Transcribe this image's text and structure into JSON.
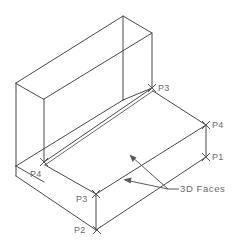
{
  "drawing": {
    "title": "3D Faces isometric wireframe",
    "canvas": {
      "width": 234,
      "height": 243,
      "background": "#ffffff"
    },
    "style": {
      "line_color": "#4a4a4a",
      "soft_line_color": "#6b6b6b",
      "text_color": "#6a6a6a",
      "marker_color": "#555555",
      "leader_color": "#5a5a5a",
      "line_width": 1
    },
    "annotations": {
      "note": "3D Faces",
      "points": [
        {
          "id": "p3-top",
          "label": "P3",
          "marker": "x-marker",
          "marker_x": 152,
          "marker_y": 88,
          "label_x": 158,
          "label_y": 91
        },
        {
          "id": "p4-right",
          "label": "P4",
          "marker": "x-marker",
          "marker_x": 206,
          "marker_y": 125,
          "label_x": 212,
          "label_y": 128
        },
        {
          "id": "p1-right",
          "label": "P1",
          "marker": "x-marker",
          "marker_x": 206,
          "marker_y": 157,
          "label_x": 212,
          "label_y": 160
        },
        {
          "id": "p4-left",
          "label": "P4",
          "marker": "x-marker",
          "marker_x": 44,
          "marker_y": 162,
          "label_x": 30,
          "label_y": 177
        },
        {
          "id": "p3-bottom",
          "label": "P3",
          "marker": "x-marker",
          "marker_x": 96,
          "marker_y": 194,
          "label_x": 76,
          "label_y": 202
        },
        {
          "id": "p2-bottom",
          "label": "P2",
          "marker": "x-marker",
          "marker_x": 97,
          "marker_y": 230,
          "label_x": 74,
          "label_y": 233
        }
      ]
    },
    "geometry": {
      "description": "L-shaped solid in isometric projection: vertical back wall on top of a horizontal base slab",
      "wall": {
        "back_top_left": [
          16,
          83
        ],
        "back_top_right": [
          123,
          16
        ],
        "front_top_right": [
          152,
          33
        ],
        "front_top_left": [
          44,
          99
        ],
        "back_bottom_left": [
          16,
          166
        ],
        "front_bottom_left": [
          44,
          162
        ],
        "front_bottom_right": [
          152,
          88
        ],
        "back_bottom_right": [
          123,
          100
        ]
      },
      "slab": {
        "top_back_left": [
          44,
          164
        ],
        "top_back_right": [
          152,
          90
        ],
        "top_front_right": [
          206,
          125
        ],
        "top_front_left": [
          96,
          194
        ],
        "bottom_front_left": [
          96,
          230
        ],
        "bottom_front_right": [
          206,
          157
        ],
        "bottom_left": [
          16,
          176
        ]
      }
    }
  }
}
